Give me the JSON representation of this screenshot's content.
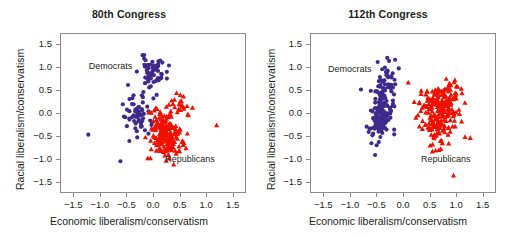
{
  "figure": {
    "width": 517,
    "height": 238,
    "background": "#ffffff"
  },
  "colors": {
    "democrat": "#3f2a8c",
    "republican": "#f01000",
    "axis": "#8b8b8b",
    "text": "#231f20"
  },
  "axes": {
    "xlabel": "Economic liberalism/conservatism",
    "ylabel": "Racial liberalism/conservatism",
    "xlim": [
      -1.75,
      1.75
    ],
    "ylim": [
      -1.75,
      1.75
    ],
    "xticks": [
      -1.5,
      -1.0,
      -0.5,
      0.0,
      0.5,
      1.0,
      1.5
    ],
    "yticks": [
      -1.5,
      -1.0,
      -0.5,
      0.0,
      0.5,
      1.0,
      1.5
    ],
    "xtick_labels": [
      "−1.5",
      "−1.0",
      "−0.5",
      "0.0",
      "0.5",
      "1.0",
      "1.5"
    ],
    "ytick_labels": [
      "−1.5",
      "−1.0",
      "−0.5",
      "0.0",
      "0.5",
      "1.0",
      "1.5"
    ],
    "grid": false,
    "legend": "annotations-inline"
  },
  "chart_data": [
    {
      "type": "scatter",
      "title": "80th Congress",
      "xlabel": "Economic liberalism/conservatism",
      "ylabel": "Racial liberalism/conservatism",
      "xlim": [
        -1.75,
        1.75
      ],
      "ylim": [
        -1.75,
        1.75
      ],
      "grid": false,
      "annotations": [
        {
          "text": "Democrats",
          "x": -0.72,
          "y": 1.0
        },
        {
          "text": "Republicans",
          "x": 0.72,
          "y": -1.02
        }
      ],
      "series": [
        {
          "name": "Democrats",
          "marker": "circle",
          "color": "#3f2a8c",
          "n": 120,
          "clusters": [
            {
              "n": 58,
              "cx": 0.0,
              "cy": 0.92,
              "sx": 0.13,
              "sy": 0.16,
              "seed": 11
            },
            {
              "n": 48,
              "cx": -0.33,
              "cy": -0.1,
              "sx": 0.14,
              "sy": 0.2,
              "seed": 23
            },
            {
              "n": 8,
              "cx": -0.2,
              "cy": 0.35,
              "sx": 0.18,
              "sy": 0.15,
              "seed": 37
            }
          ],
          "outliers": [
            [
              -1.23,
              -0.48
            ],
            [
              -0.62,
              -1.07
            ],
            [
              -0.45,
              -0.62
            ],
            [
              -0.3,
              -0.54
            ],
            [
              0.07,
              0.4
            ]
          ]
        },
        {
          "name": "Republicans",
          "marker": "triangle",
          "color": "#f01000",
          "n": 215,
          "clusters": [
            {
              "n": 150,
              "cx": 0.24,
              "cy": -0.42,
              "sx": 0.13,
              "sy": 0.24,
              "seed": 47
            },
            {
              "n": 45,
              "cx": 0.35,
              "cy": -0.72,
              "sx": 0.14,
              "sy": 0.16,
              "seed": 59
            },
            {
              "n": 16,
              "cx": 0.52,
              "cy": 0.22,
              "sx": 0.1,
              "sy": 0.15,
              "seed": 71
            }
          ],
          "outliers": [
            [
              1.21,
              -0.27
            ],
            [
              0.66,
              -0.03
            ],
            [
              0.58,
              0.37
            ],
            [
              0.52,
              0.4
            ],
            [
              -0.1,
              -1.0
            ],
            [
              -0.05,
              -1.0
            ]
          ]
        }
      ]
    },
    {
      "type": "scatter",
      "title": "112th Congress",
      "xlabel": "Economic liberalism/conservatism",
      "ylabel": "Racial liberalism/conservatism",
      "xlim": [
        -1.75,
        1.75
      ],
      "ylim": [
        -1.75,
        1.75
      ],
      "grid": false,
      "annotations": [
        {
          "text": "Democrats",
          "x": -0.92,
          "y": 0.95
        },
        {
          "text": "Republicans",
          "x": 0.83,
          "y": -1.03
        }
      ],
      "series": [
        {
          "name": "Democrats",
          "marker": "circle",
          "color": "#3f2a8c",
          "n": 190,
          "clusters": [
            {
              "n": 130,
              "cx": -0.45,
              "cy": -0.05,
              "sx": 0.11,
              "sy": 0.24,
              "seed": 13
            },
            {
              "n": 45,
              "cx": -0.34,
              "cy": 0.55,
              "sx": 0.11,
              "sy": 0.2,
              "seed": 29
            },
            {
              "n": 12,
              "cx": -0.25,
              "cy": 0.95,
              "sx": 0.12,
              "sy": 0.12,
              "seed": 41
            }
          ],
          "outliers": [
            [
              -0.8,
              0.52
            ],
            [
              -0.53,
              -0.93
            ],
            [
              -0.6,
              -0.67
            ],
            [
              -0.15,
              1.18
            ],
            [
              -0.3,
              1.22
            ]
          ]
        },
        {
          "name": "Republicans",
          "marker": "triangle",
          "color": "#f01000",
          "n": 240,
          "clusters": [
            {
              "n": 170,
              "cx": 0.7,
              "cy": 0.15,
              "sx": 0.18,
              "sy": 0.22,
              "seed": 53
            },
            {
              "n": 50,
              "cx": 0.62,
              "cy": -0.35,
              "sx": 0.14,
              "sy": 0.17,
              "seed": 67
            },
            {
              "n": 14,
              "cx": 0.86,
              "cy": 0.5,
              "sx": 0.1,
              "sy": 0.1,
              "seed": 79
            }
          ],
          "outliers": [
            [
              0.1,
              0.68
            ],
            [
              1.28,
              -0.55
            ],
            [
              1.18,
              -0.53
            ],
            [
              0.96,
              -1.38
            ],
            [
              0.62,
              -0.83
            ],
            [
              0.68,
              -0.82
            ],
            [
              0.56,
              -0.85
            ]
          ]
        }
      ]
    }
  ]
}
